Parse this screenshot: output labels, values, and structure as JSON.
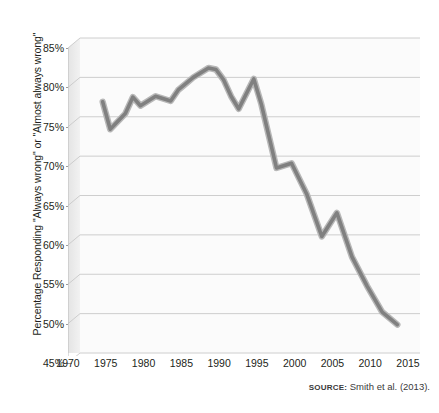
{
  "figure": {
    "title_cropped_fragment": "",
    "source_keyword": "SOURCE:",
    "source_text": "Smith et al. (2013)."
  },
  "chart_data": {
    "type": "line",
    "title": "",
    "xlabel": "",
    "ylabel": "Percentage Responding \"Always wrong\" or \"Almost always wrong\"",
    "xlim": [
      1970,
      2015
    ],
    "ylim": [
      45,
      85
    ],
    "grid": true,
    "legend": "none",
    "line_color": "#808080",
    "line_outline_color": "#b8b8b8",
    "plot_background": "#fbfbfb",
    "gridline_color": "#c8c8c8",
    "xticks": [
      1970,
      1975,
      1980,
      1985,
      1990,
      1995,
      2000,
      2005,
      2010,
      2015
    ],
    "xticklabels": [
      "1970",
      "1975",
      "1980",
      "1985",
      "1990",
      "1995",
      "2000",
      "2005",
      "2010",
      "2015"
    ],
    "yticks": [
      45,
      50,
      55,
      60,
      65,
      70,
      75,
      80,
      85
    ],
    "yticklabels": [
      "45%",
      "50%",
      "55%",
      "60%",
      "65%",
      "70%",
      "75%",
      "80%",
      "85%"
    ],
    "x": [
      1973,
      1974,
      1976,
      1977,
      1978,
      1980,
      1982,
      1983,
      1984,
      1985,
      1987,
      1988,
      1989,
      1990,
      1991,
      1993,
      1994,
      1996,
      1998,
      2000,
      2002,
      2004,
      2006,
      2008,
      2010,
      2012
    ],
    "values": [
      76.9,
      73.4,
      75.4,
      77.5,
      76.4,
      77.6,
      77.0,
      78.4,
      79.2,
      80.0,
      81.2,
      81.0,
      79.7,
      77.6,
      76.0,
      79.8,
      76.6,
      68.5,
      69.1,
      65.2,
      59.8,
      62.8,
      57.2,
      53.5,
      50.2,
      48.6
    ]
  }
}
